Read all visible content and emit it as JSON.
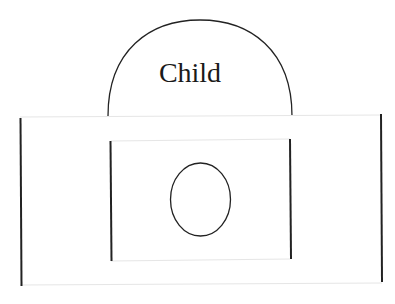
{
  "diagram": {
    "title": "Child",
    "colors": {
      "stroke": "#222222",
      "faint_line": "#e6e6e6",
      "background": "#ffffff",
      "text": "#1a1a1a"
    },
    "shapes": {
      "dome": {
        "label": "Child",
        "cx": 200,
        "cy": 115,
        "rx": 92,
        "ry": 95
      },
      "outer_frame": {
        "x1": 19,
        "y1": 117,
        "x2": 382,
        "y2": 284
      },
      "inner_frame": {
        "x1": 110,
        "y1": 140,
        "x2": 291,
        "y2": 260
      },
      "ellipse": {
        "cx": 200,
        "cy": 199,
        "rx": 30,
        "ry": 37
      }
    }
  }
}
